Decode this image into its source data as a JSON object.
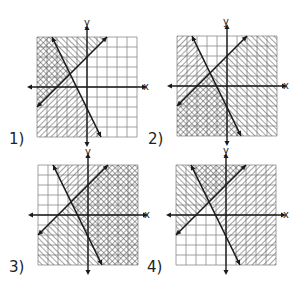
{
  "problems": [
    {
      "label": "1)",
      "shade_rising": "above",
      "shade_falling": "left",
      "x_label": "x",
      "y_label": "y"
    },
    {
      "label": "2)",
      "shade_rising": "below",
      "shade_falling": "left",
      "x_label": "x",
      "y_label": "y"
    },
    {
      "label": "3)",
      "shade_rising": "below",
      "shade_falling": "right",
      "x_label": "x",
      "y_label": "y"
    },
    {
      "label": "4)",
      "shade_rising": "above",
      "shade_falling": "right",
      "x_label": "x",
      "y_label": "y"
    }
  ],
  "grid": {
    "cells": 10,
    "axis_col": 5,
    "axis_row": 5
  },
  "lines": {
    "rising": {
      "from": [
        0,
        70
      ],
      "to": [
        70,
        0
      ]
    },
    "falling": {
      "from": [
        15,
        0
      ],
      "to": [
        64,
        100
      ]
    }
  },
  "colors": {
    "grid": "#8a8a8a",
    "line": "#1a1a1a",
    "hatch": "#555555"
  }
}
